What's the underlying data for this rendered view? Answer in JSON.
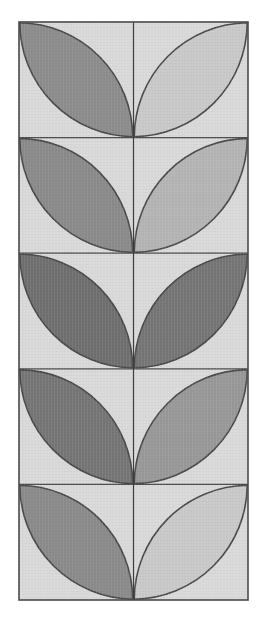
{
  "figure": {
    "canvas": {
      "width": 265,
      "height": 635,
      "background": "#ffffff"
    },
    "panel": {
      "name": "outer-panel",
      "x": 19,
      "y": 22,
      "width": 229,
      "height": 578,
      "fill": "#d9d9d9",
      "stroke": "#4a4a4a",
      "stroke_width": 1.6
    },
    "grid": {
      "rows": 5,
      "columns": 1,
      "cell_width": 229,
      "cell_height": 115.6,
      "divider_color": "#4a4a4a",
      "divider_width": 1.2,
      "horizontal_divider_y": [
        137.6,
        253.2,
        368.8,
        484.4
      ],
      "vertical_center_x": 133.5,
      "vertical_center_color": "#3c3c3c",
      "vertical_center_width": 1.2
    },
    "motif": {
      "name": "twin-petal-leaf",
      "description": "Two vesica-shaped petals per cell formed by two intersecting quarter-circle arcs, joined at the bottom-center vertex of the cell",
      "petal_stroke": "#4a4a4a",
      "petal_stroke_width": 1.6,
      "cell_background": "#d9d9d9"
    },
    "rows": [
      {
        "index": 1,
        "label": "row-1",
        "y": 22,
        "left_petal": {
          "name": "petal-left",
          "fill": "#8c8c8c",
          "shade": "medium-dark"
        },
        "right_petal": {
          "name": "petal-right",
          "fill": "#c9c9c9",
          "shade": "very-light"
        }
      },
      {
        "index": 2,
        "label": "row-2",
        "y": 137.6,
        "left_petal": {
          "name": "petal-left",
          "fill": "#8a8a8a",
          "shade": "medium-dark"
        },
        "right_petal": {
          "name": "petal-right",
          "fill": "#b4b4b4",
          "shade": "light-medium"
        }
      },
      {
        "index": 3,
        "label": "row-3",
        "y": 253.2,
        "left_petal": {
          "name": "petal-left",
          "fill": "#6f6f6f",
          "shade": "dark"
        },
        "right_petal": {
          "name": "petal-right",
          "fill": "#757575",
          "shade": "dark"
        }
      },
      {
        "index": 4,
        "label": "row-4",
        "y": 368.8,
        "left_petal": {
          "name": "petal-left",
          "fill": "#757575",
          "shade": "dark"
        },
        "right_petal": {
          "name": "petal-right",
          "fill": "#989898",
          "shade": "medium"
        }
      },
      {
        "index": 5,
        "label": "row-5",
        "y": 484.4,
        "left_petal": {
          "name": "petal-left",
          "fill": "#8a8a8a",
          "shade": "medium-dark"
        },
        "right_petal": {
          "name": "petal-right",
          "fill": "#c9c9c9",
          "shade": "very-light"
        }
      }
    ]
  }
}
